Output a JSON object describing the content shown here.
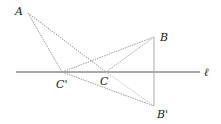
{
  "diagram": {
    "line_label": "ℓ",
    "points": {
      "A": {
        "label": "A",
        "x": 28,
        "y": 13
      },
      "B": {
        "label": "B",
        "x": 154,
        "y": 37
      },
      "Bp": {
        "label": "B'",
        "x": 154,
        "y": 106
      },
      "C": {
        "label": "C",
        "x": 106,
        "y": 72
      },
      "Cp": {
        "label": "C'",
        "x": 62,
        "y": 72
      }
    },
    "line": {
      "x1": 16,
      "y1": 72,
      "x2": 200,
      "y2": 72
    },
    "segments": [
      {
        "from": "A",
        "to": "Cp",
        "style": "dotted"
      },
      {
        "from": "A",
        "to": "B",
        "style": "dotted"
      },
      {
        "from": "Cp",
        "to": "B",
        "style": "dotted"
      },
      {
        "from": "Cp",
        "to": "Bp",
        "style": "dotted"
      },
      {
        "from": "B",
        "to": "Bp",
        "style": "solid-light"
      },
      {
        "from": "C",
        "to": "B",
        "style": "dotted"
      }
    ],
    "colors": {
      "line": "#555555",
      "segment": "#9a9a9a",
      "label": "#222222"
    }
  }
}
